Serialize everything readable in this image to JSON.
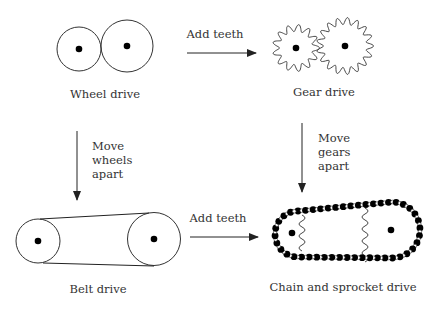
{
  "diagram": {
    "title": "",
    "nodes": [
      {
        "id": "wheel",
        "label": "Wheel drive"
      },
      {
        "id": "gear",
        "label": "Gear drive"
      },
      {
        "id": "belt",
        "label": "Belt drive"
      },
      {
        "id": "chain",
        "label": "Chain and sprocket drive"
      }
    ],
    "edges": [
      {
        "from": "wheel",
        "to": "gear",
        "label": "Add teeth"
      },
      {
        "from": "belt",
        "to": "chain",
        "label": "Add teeth"
      },
      {
        "from": "wheel",
        "to": "belt",
        "label_lines": [
          "Move",
          "wheels",
          "apart"
        ]
      },
      {
        "from": "gear",
        "to": "chain",
        "label_lines": [
          "Move",
          "gears",
          "apart"
        ]
      }
    ],
    "colors": {
      "stroke": "#333333",
      "fill": "#000000",
      "background": "#ffffff"
    }
  }
}
